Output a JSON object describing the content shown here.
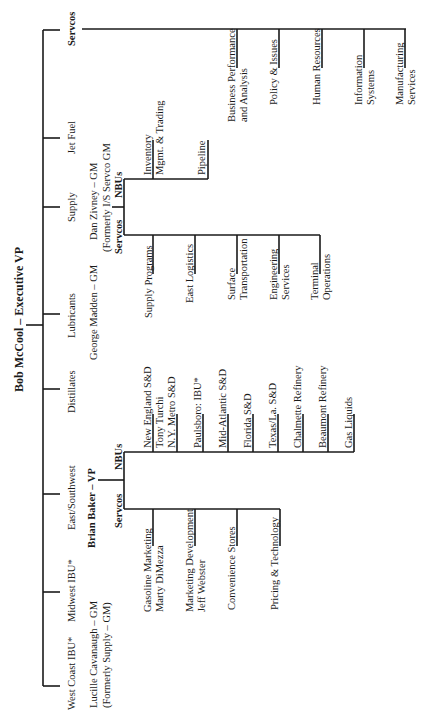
{
  "chart": {
    "title": "Bob McCool – Executive VP",
    "divisions": [
      {
        "label": "West Coast IBU*"
      },
      {
        "label": "Midwest IBU*"
      },
      {
        "label": "East/Southwest"
      },
      {
        "label": "Distillates"
      },
      {
        "label": "Lubricants"
      },
      {
        "label": "Supply"
      },
      {
        "label": "Jet Fuel"
      },
      {
        "label": "Servcos"
      }
    ],
    "managers": {
      "west_coast": {
        "line1": "Lucille Cavanaugh – GM",
        "line2": "(Formerly Supply – GM)"
      },
      "east_southwest": {
        "line1": "Brian Baker – VP"
      },
      "lubricants": {
        "line1": "George Madden – GM"
      },
      "supply": {
        "line1": "Dan Zivney – GM",
        "line2": "(Formerly I/S Servco GM"
      }
    },
    "east_southwest_group": {
      "servcos_label": "Servcos",
      "nbus_label": "NBUs",
      "servcos": [
        {
          "line1": "Gasoline Marketing",
          "line2": "Marty DiMezza"
        },
        {
          "line1": "Marketing Development",
          "line2": "Jeff Webster"
        },
        {
          "line1": "Convenience Stores"
        },
        {
          "line1": "Pricing & Technology"
        }
      ],
      "nbus": [
        {
          "line1": "New England S&D",
          "line2": "Tony Turchi"
        },
        {
          "line1": "N.Y. Metro S&D"
        },
        {
          "line1": "Paulsboro: IBU*"
        },
        {
          "line1": "Mid-Atlantic S&D"
        },
        {
          "line1": "Florida S&D"
        },
        {
          "line1": "Texas/La. S&D"
        },
        {
          "line1": "Chalmette Refinery"
        },
        {
          "line1": "Beaumont Refinery"
        },
        {
          "line1": "Gas Liquids"
        }
      ]
    },
    "supply_group": {
      "servcos_label": "Servcos",
      "nbus_label": "NBUs",
      "servcos": [
        {
          "line1": "Supply Programs"
        },
        {
          "line1": "East Logistics"
        },
        {
          "line1": "Surface",
          "line2": "Transportation"
        },
        {
          "line1": "Engineering",
          "line2": "Services"
        },
        {
          "line1": "Terminal",
          "line2": "Operations"
        }
      ],
      "nbus": [
        {
          "line1": "Inventory",
          "line2": "Mgmt. & Trading"
        },
        {
          "line1": "Pipeline"
        }
      ]
    },
    "corporate_servcos": [
      {
        "line1": "Business Performance",
        "line2": "and Analysis"
      },
      {
        "line1": "Policy & Issues"
      },
      {
        "line1": "Human Resources"
      },
      {
        "line1": "Information",
        "line2": "Systems"
      },
      {
        "line1": "Manufacturing",
        "line2": "Services"
      }
    ]
  }
}
